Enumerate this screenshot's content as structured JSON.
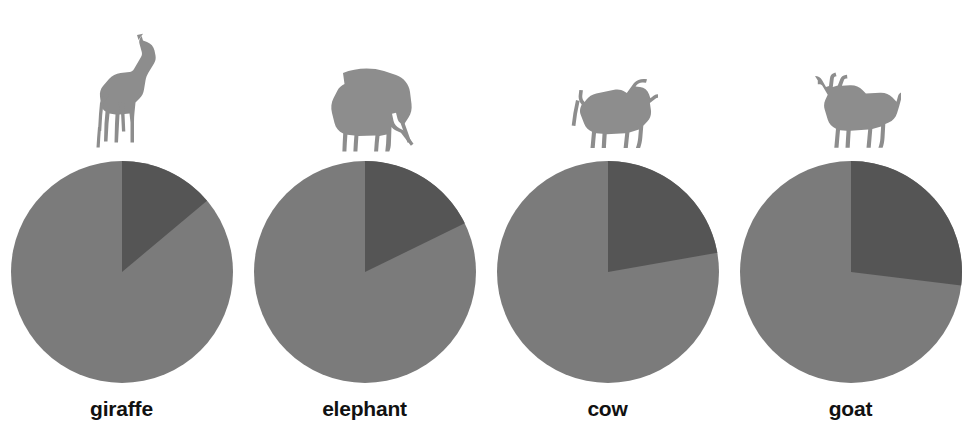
{
  "figure": {
    "background_color": "#ffffff",
    "label_color": "#111111"
  },
  "palette": {
    "slice_light": "#7b7b7b",
    "slice_dark": "#555555",
    "silhouette": "#8d8d8d"
  },
  "panels": [
    {
      "label": "giraffe",
      "icon_name": "giraffe-silhouette-icon",
      "dark_share_percent": 14,
      "light_share_percent": 86,
      "dark_angle_deg": 50
    },
    {
      "label": "elephant",
      "icon_name": "elephant-silhouette-icon",
      "dark_share_percent": 18,
      "light_share_percent": 82,
      "dark_angle_deg": 64
    },
    {
      "label": "cow",
      "icon_name": "cow-silhouette-icon",
      "dark_share_percent": 22,
      "light_share_percent": 78,
      "dark_angle_deg": 80
    },
    {
      "label": "goat",
      "icon_name": "goat-silhouette-icon",
      "dark_share_percent": 27,
      "light_share_percent": 73,
      "dark_angle_deg": 97
    }
  ],
  "chart_data": {
    "type": "pie",
    "title": "",
    "subtitle": "",
    "xlabel": "",
    "ylabel": "",
    "legend_position": "none",
    "grid": false,
    "categories": [
      "giraffe",
      "elephant",
      "cow",
      "goat"
    ],
    "slice_labels": [
      "dark segment",
      "light segment"
    ],
    "charts": [
      {
        "name": "giraffe",
        "values": [
          14,
          86
        ],
        "angles_deg": [
          50,
          310
        ],
        "start_angle_deg": 0,
        "direction": "clockwise"
      },
      {
        "name": "elephant",
        "values": [
          18,
          82
        ],
        "angles_deg": [
          64,
          296
        ],
        "start_angle_deg": 0,
        "direction": "clockwise"
      },
      {
        "name": "cow",
        "values": [
          22,
          78
        ],
        "angles_deg": [
          80,
          280
        ],
        "start_angle_deg": 0,
        "direction": "clockwise"
      },
      {
        "name": "goat",
        "values": [
          27,
          73
        ],
        "angles_deg": [
          97,
          263
        ],
        "start_angle_deg": 0,
        "direction": "clockwise"
      }
    ]
  }
}
